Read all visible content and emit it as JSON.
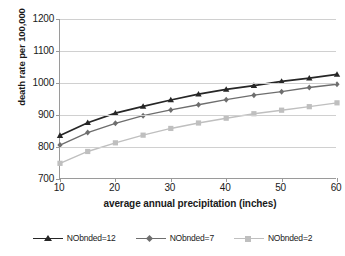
{
  "chart_data": {
    "type": "line",
    "title": "",
    "xlabel": "average annual precipitation (inches)",
    "ylabel": "death rate per 100,000",
    "x": [
      10,
      15,
      20,
      25,
      30,
      35,
      40,
      45,
      50,
      55,
      60
    ],
    "xlim": [
      10,
      60
    ],
    "ylim": [
      700,
      1200
    ],
    "xticks": [
      10,
      20,
      30,
      40,
      50,
      60
    ],
    "yticks": [
      700,
      800,
      900,
      1000,
      1100,
      1200
    ],
    "xtick_labels": [
      "10",
      "20",
      "30",
      "40",
      "50",
      "60"
    ],
    "ytick_labels": [
      "700",
      "800",
      "900",
      "1000",
      "1100",
      "1200"
    ],
    "grid": "horizontal",
    "legend_position": "bottom",
    "series": [
      {
        "name": "NObnded=12",
        "color": "#262626",
        "marker": "triangle",
        "values": [
          836,
          876,
          906,
          927,
          947,
          965,
          980,
          992,
          1005,
          1015,
          1027
        ]
      },
      {
        "name": "NObnded=7",
        "color": "#6e6e6e",
        "marker": "diamond",
        "values": [
          806,
          845,
          874,
          898,
          916,
          932,
          948,
          962,
          973,
          986,
          996
        ]
      },
      {
        "name": "NObnded=2",
        "color": "#bfbfbf",
        "marker": "square",
        "values": [
          749,
          786,
          813,
          837,
          858,
          875,
          890,
          904,
          915,
          926,
          938
        ]
      }
    ]
  },
  "axes": {
    "gridline_color": "#d0d0d0",
    "axis_color": "#9a9a9a",
    "background": "#ffffff"
  }
}
